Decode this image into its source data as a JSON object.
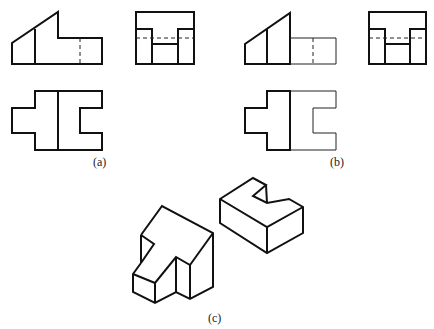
{
  "figure": {
    "panels": [
      {
        "id": "a",
        "label": "(a)",
        "views": [
          "front-view",
          "side-view",
          "top-view"
        ]
      },
      {
        "id": "b",
        "label": "(b)",
        "views": [
          "front-view",
          "side-view",
          "top-view"
        ]
      },
      {
        "id": "c",
        "label": "(c)",
        "views": [
          "isometric-t-block",
          "isometric-c-block"
        ]
      }
    ],
    "colors": {
      "line": "#111111",
      "background": "#ffffff"
    }
  }
}
